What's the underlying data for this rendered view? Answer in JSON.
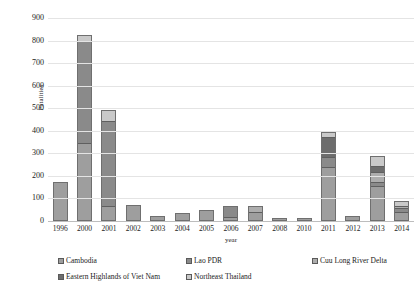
{
  "chart_data": {
    "type": "bar",
    "subtype": "stacked-column",
    "title": "",
    "xlabel": "year",
    "ylabel": "Fatalities",
    "ylim": [
      0,
      900
    ],
    "ytick_step": 100,
    "yticks": [
      900,
      800,
      700,
      600,
      500,
      400,
      300,
      200,
      100,
      0
    ],
    "grid": true,
    "legend_position": "bottom",
    "categories": [
      "1996",
      "2000",
      "2001",
      "2002",
      "2003",
      "2004",
      "2005",
      "2006",
      "2007",
      "2008",
      "2010",
      "2011",
      "2012",
      "2013",
      "2014"
    ],
    "series": [
      {
        "name": "Cambodia",
        "color": "#9e9e9e",
        "values": [
          172,
          345,
          58,
          72,
          22,
          34,
          48,
          12,
          38,
          14,
          12,
          242,
          24,
          160,
          42
        ]
      },
      {
        "name": "Lao PDR",
        "color": "#8a8a8a",
        "values": [
          0,
          455,
          390,
          0,
          0,
          0,
          0,
          55,
          0,
          0,
          0,
          43,
          0,
          15,
          16
        ]
      },
      {
        "name": "Cuu Long River Delta",
        "color": "#adadad",
        "values": [
          0,
          0,
          0,
          0,
          0,
          0,
          0,
          0,
          28,
          0,
          0,
          0,
          0,
          47,
          10
        ]
      },
      {
        "name": "Eastern Highlands of Viet Nam",
        "color": "#6d6d6d",
        "values": [
          0,
          0,
          0,
          0,
          0,
          0,
          0,
          0,
          0,
          0,
          0,
          93,
          0,
          20,
          0
        ]
      },
      {
        "name": "Northeast Thailand",
        "color": "#c9c9c9",
        "values": [
          0,
          23,
          42,
          0,
          0,
          0,
          0,
          0,
          0,
          0,
          0,
          17,
          0,
          45,
          19
        ]
      }
    ],
    "totals": [
      172,
      823,
      490,
      72,
      22,
      34,
      48,
      67,
      66,
      14,
      12,
      395,
      24,
      287,
      87
    ]
  },
  "axes": {
    "y_title": "Fatalities",
    "x_title": "year"
  },
  "legend": {
    "rows": [
      [
        {
          "label": "Cambodia",
          "swatch": "sw0"
        },
        {
          "label": "Lao PDR",
          "swatch": "sw1"
        },
        {
          "label": "Cuu Long River Delta",
          "swatch": "sw2"
        }
      ],
      [
        {
          "label": "Eastern Highlands of Viet Nam",
          "swatch": "sw3"
        },
        {
          "label": "Northeast Thailand",
          "swatch": "sw4"
        }
      ]
    ]
  }
}
